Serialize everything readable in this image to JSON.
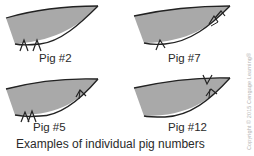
{
  "figure": {
    "caption": "Examples of individual pig numbers",
    "copyright": "Copyright © 2015 Cengage Learning®",
    "fill_color": "#a9a9a9",
    "outline_color": "#222222",
    "ears": [
      {
        "label": "Pig #2",
        "notches": [
          "bottom",
          "bottom"
        ]
      },
      {
        "label": "Pig #7",
        "notches": [
          "bottom",
          "upper-right-tip",
          "upper-right-tip"
        ]
      },
      {
        "label": "Pig #5",
        "notches": [
          "bottom",
          "bottom",
          "bottom-right"
        ]
      },
      {
        "label": "Pig #12",
        "notches": [
          "top-right",
          "bottom-right"
        ]
      }
    ]
  }
}
